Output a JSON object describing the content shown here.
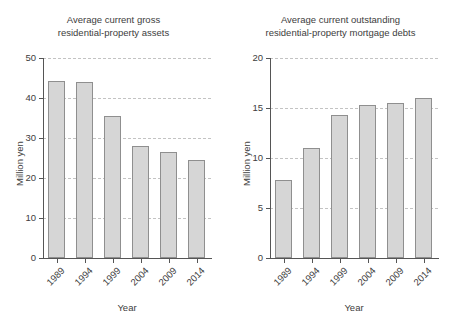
{
  "figure": {
    "width": 454,
    "height": 319,
    "background": "#ffffff",
    "bar_fill": "#d6d6d6",
    "bar_edge": "#8f8f8f",
    "grid_color": "#c3c3c3",
    "axis_color": "#555555",
    "text_color": "#3d3d3d"
  },
  "chart_data": [
    {
      "type": "bar",
      "title": "Average current gross\nresidential-property assets",
      "title_line1": "Average current gross",
      "title_line2": "residential-property assets",
      "xlabel": "Year",
      "ylabel": "Million yen",
      "categories": [
        "1989",
        "1994",
        "1999",
        "2004",
        "2009",
        "2014"
      ],
      "values": [
        44.2,
        44.1,
        35.4,
        28.1,
        26.4,
        24.6
      ],
      "ylim": [
        0,
        50
      ],
      "yticks": [
        0,
        10,
        20,
        30,
        40,
        50
      ],
      "ytick_labels": [
        "0",
        "10",
        "20",
        "30",
        "40",
        "50"
      ],
      "grid": true,
      "grid_axis": "y",
      "legend": "none"
    },
    {
      "type": "bar",
      "title": "Average current outstanding\nresidential-property mortgage debts",
      "title_line1": "Average current outstanding",
      "title_line2": "residential-property mortgage debts",
      "xlabel": "Year",
      "ylabel": "Million yen",
      "categories": [
        "1989",
        "1994",
        "1999",
        "2004",
        "2009",
        "2014"
      ],
      "values": [
        7.8,
        11.0,
        14.3,
        15.3,
        15.5,
        16.0
      ],
      "ylim": [
        0,
        20
      ],
      "yticks": [
        0,
        5,
        10,
        15,
        20
      ],
      "ytick_labels": [
        "0",
        "5",
        "10",
        "15",
        "20"
      ],
      "grid": true,
      "grid_axis": "y",
      "legend": "none"
    }
  ]
}
